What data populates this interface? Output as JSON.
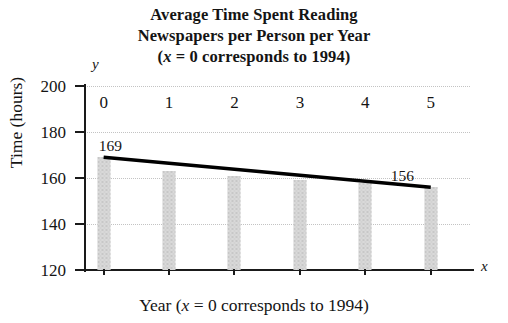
{
  "title": {
    "line1": "Average Time Spent Reading",
    "line2": "Newspapers per Person per Year",
    "line3_pre": "(",
    "line3_var": "x",
    "line3_post": " = 0 corresponds to 1994)"
  },
  "axis": {
    "y_glyph": "y",
    "x_glyph": "x",
    "y_title": "Time (hours)",
    "x_title_pre": "Year (",
    "x_title_var": "x",
    "x_title_post": " = 0 corresponds to 1994)"
  },
  "labels": {
    "first_point": "169",
    "last_point": "156"
  },
  "colors": {
    "bar_fill": "#d9d9d9",
    "axis": "#1a1a1a",
    "grid": "#c3c3c3",
    "line": "#000000"
  },
  "chart_data": {
    "type": "bar",
    "title": "Average Time Spent Reading Newspapers per Person per Year (x = 0 corresponds to 1994)",
    "xlabel": "Year (x = 0 corresponds to 1994)",
    "ylabel": "Time (hours)",
    "categories": [
      "0",
      "1",
      "2",
      "3",
      "4",
      "5"
    ],
    "x": [
      0,
      1,
      2,
      3,
      4,
      5
    ],
    "values": [
      169,
      163,
      161,
      159,
      158,
      156
    ],
    "ylim": [
      120,
      200
    ],
    "yticks": [
      120,
      140,
      160,
      180,
      200
    ],
    "xlim": [
      -0.3,
      5.6
    ],
    "xticks": [
      0,
      1,
      2,
      3,
      4,
      5
    ],
    "grid": true,
    "legend": "none",
    "annotations": [
      {
        "text": "169",
        "x": 0,
        "y": 169
      },
      {
        "text": "156",
        "x": 5,
        "y": 156
      }
    ],
    "series": [
      {
        "name": "Average hours reading newspapers",
        "type": "bar",
        "values": [
          169,
          163,
          161,
          159,
          158,
          156
        ]
      },
      {
        "name": "Linear trend",
        "type": "line",
        "points": [
          {
            "x": 0,
            "y": 169
          },
          {
            "x": 5,
            "y": 156
          }
        ]
      }
    ]
  }
}
